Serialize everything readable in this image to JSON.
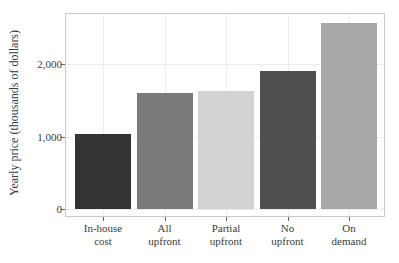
{
  "chart_data": {
    "type": "bar",
    "title": "",
    "xlabel": "",
    "ylabel": "Yearly price (thousands of dollars)",
    "categories": [
      "In-house cost",
      "All upfront",
      "Partial upfront",
      "No upfront",
      "On demand"
    ],
    "category_lines": [
      [
        "In-house",
        "cost"
      ],
      [
        "All",
        "upfront"
      ],
      [
        "Partial",
        "upfront"
      ],
      [
        "No",
        "upfront"
      ],
      [
        "On",
        "demand"
      ]
    ],
    "values": [
      1030,
      1600,
      1625,
      1900,
      2565
    ],
    "colors": [
      "#333333",
      "#7a7a7a",
      "#d2d2d2",
      "#4f4f4f",
      "#a8a8a8"
    ],
    "yticks": [
      0,
      1000,
      2000
    ],
    "ytick_labels": [
      "0",
      "1,000",
      "2,000"
    ],
    "ylim": [
      -100,
      2700
    ],
    "grid": true,
    "legend": "none"
  }
}
